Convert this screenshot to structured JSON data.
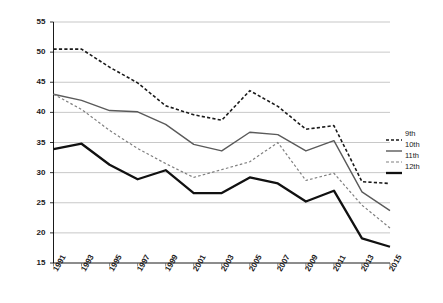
{
  "chart_data": {
    "type": "line",
    "title": "",
    "subtitle": "",
    "xlabel": "",
    "ylabel": "",
    "x": [
      "1991",
      "1993",
      "1995",
      "1997",
      "1999",
      "2001",
      "2003",
      "2005",
      "2007",
      "2009",
      "2011",
      "2013",
      "2015"
    ],
    "categories": [
      "1991",
      "1993",
      "1995",
      "1997",
      "1999",
      "2001",
      "2003",
      "2005",
      "2007",
      "2009",
      "2011",
      "2013",
      "2015"
    ],
    "xlim": [
      1991,
      2015
    ],
    "ylim": [
      15,
      55
    ],
    "yticks": [
      15,
      20,
      25,
      30,
      35,
      40,
      45,
      50,
      55
    ],
    "ytick_labels": [
      "15",
      "20",
      "25",
      "30",
      "35",
      "40",
      "45",
      "50",
      "55"
    ],
    "grid": "horizontal",
    "legend_position": "right",
    "series": [
      {
        "name": "9th",
        "style": "dashed",
        "color": "#1a1a1a",
        "width": 1.6,
        "values": [
          50.5,
          50.5,
          47.5,
          44.9,
          41.1,
          39.6,
          38.7,
          43.6,
          41.0,
          37.2,
          37.8,
          28.5,
          28.2
        ]
      },
      {
        "name": "10th",
        "style": "solid",
        "color": "#5a5a5a",
        "width": 1.4,
        "values": [
          43.0,
          42.0,
          40.3,
          40.1,
          38.0,
          34.7,
          33.6,
          36.7,
          36.3,
          33.6,
          35.3,
          26.8,
          23.7
        ]
      },
      {
        "name": "11th",
        "style": "dashed",
        "color": "#808080",
        "width": 1.2,
        "values": [
          43.0,
          40.5,
          37.0,
          34.0,
          31.5,
          29.2,
          30.5,
          31.8,
          35.0,
          28.7,
          29.9,
          24.6,
          20.8
        ]
      },
      {
        "name": "12th",
        "style": "solid",
        "color": "#111111",
        "width": 2.3,
        "values": [
          33.9,
          34.8,
          31.3,
          28.9,
          30.4,
          26.6,
          26.6,
          29.2,
          28.2,
          25.2,
          27.0,
          19.1,
          17.7
        ]
      }
    ]
  },
  "legend": {
    "items": [
      {
        "label": "9th"
      },
      {
        "label": "10th"
      },
      {
        "label": "11th"
      },
      {
        "label": "12th"
      }
    ]
  }
}
